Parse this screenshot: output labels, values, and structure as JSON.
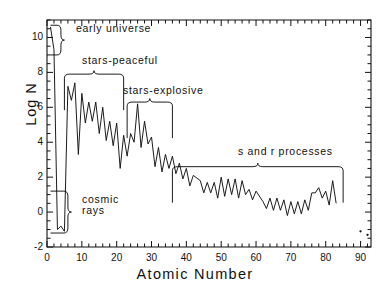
{
  "chart_data": {
    "type": "line",
    "title": "",
    "xlabel": "Atomic Number",
    "ylabel": "Log N",
    "xlim": [
      0,
      93
    ],
    "ylim": [
      -2,
      11
    ],
    "xticks": [
      0,
      10,
      20,
      30,
      40,
      50,
      60,
      70,
      80,
      90
    ],
    "yticks": [
      10,
      8,
      6,
      4,
      2,
      0,
      -2
    ],
    "xtick_labels": [
      "0",
      "10",
      "20",
      "30",
      "40",
      "50",
      "60",
      "70",
      "80",
      "90"
    ],
    "ytick_labels": [
      "10",
      "8",
      "6",
      "4",
      "2",
      "0",
      "-2"
    ],
    "xminor_step": 2,
    "yminor_step": 0.5,
    "grid": false,
    "legend": "none",
    "line_color": "#111111",
    "series": [
      {
        "name": "Solar system abundance",
        "x": [
          1,
          2,
          3,
          4,
          5,
          6,
          7,
          8,
          9,
          10,
          11,
          12,
          13,
          14,
          15,
          16,
          17,
          18,
          19,
          20,
          21,
          22,
          23,
          24,
          25,
          26,
          27,
          28,
          29,
          30,
          31,
          32,
          33,
          34,
          35,
          36,
          37,
          38,
          39,
          40,
          41,
          42,
          44,
          45,
          46,
          47,
          48,
          49,
          50,
          51,
          52,
          53,
          54,
          55,
          56,
          57,
          58,
          59,
          60,
          62,
          63,
          64,
          65,
          66,
          67,
          68,
          69,
          70,
          71,
          72,
          73,
          74,
          75,
          76,
          77,
          78,
          79,
          80,
          81,
          82,
          83
        ],
        "y": [
          10.6,
          9.3,
          -1.0,
          -0.8,
          -1.1,
          7.2,
          6.4,
          7.4,
          3.3,
          6.8,
          5.1,
          6.3,
          5.2,
          6.3,
          4.5,
          6.0,
          4.1,
          5.2,
          3.8,
          5.1,
          2.5,
          4.4,
          3.2,
          4.5,
          4.0,
          6.2,
          3.7,
          5.2,
          3.9,
          4.3,
          2.6,
          3.7,
          2.3,
          3.3,
          2.5,
          3.2,
          2.2,
          2.8,
          1.9,
          2.5,
          1.5,
          2.1,
          1.8,
          1.1,
          1.7,
          1.1,
          1.7,
          0.8,
          2.0,
          0.9,
          1.9,
          1.0,
          1.9,
          0.8,
          1.8,
          1.0,
          1.3,
          0.7,
          1.2,
          0.6,
          0.2,
          0.8,
          0.1,
          0.8,
          0.1,
          0.7,
          -0.2,
          0.6,
          -0.1,
          0.6,
          -0.1,
          0.7,
          0.1,
          1.1,
          1.1,
          1.4,
          0.8,
          1.2,
          0.4,
          1.8,
          0.5
        ]
      },
      {
        "name": "Actinides (isolated points)",
        "style": "points",
        "x": [
          90,
          92
        ],
        "y": [
          -1.1,
          -1.3
        ]
      }
    ],
    "annotations": [
      {
        "id": "early-universe",
        "label": "early universe",
        "brace": "vertical",
        "x_range": [
          1,
          4
        ],
        "y_range": [
          9.0,
          10.7
        ]
      },
      {
        "id": "stars-peaceful",
        "label": "stars-peaceful",
        "brace": "horizontal",
        "x_range": [
          5,
          22
        ],
        "y_top": 7.9
      },
      {
        "id": "stars-explosive",
        "label": "stars-explosive",
        "brace": "horizontal",
        "x_range": [
          23,
          36
        ],
        "y_top": 6.3
      },
      {
        "id": "s-and-r-processes",
        "label": "s and r processes",
        "brace": "horizontal",
        "x_range": [
          36,
          85
        ],
        "y_top": 2.6
      },
      {
        "id": "cosmic-rays",
        "label": "cosmic rays",
        "brace": "vertical",
        "x_range": [
          1,
          6
        ],
        "y_range": [
          -1.2,
          1.2
        ]
      }
    ]
  },
  "axes": {
    "xlabel": "Atomic Number",
    "ylabel": "Log N"
  },
  "annotation_text": {
    "early_universe": "early universe",
    "stars_peaceful": "stars-peaceful",
    "stars_explosive": "stars-explosive",
    "s_and_r": "s and r processes",
    "cosmic_line1": "cosmic",
    "cosmic_line2": "rays"
  }
}
